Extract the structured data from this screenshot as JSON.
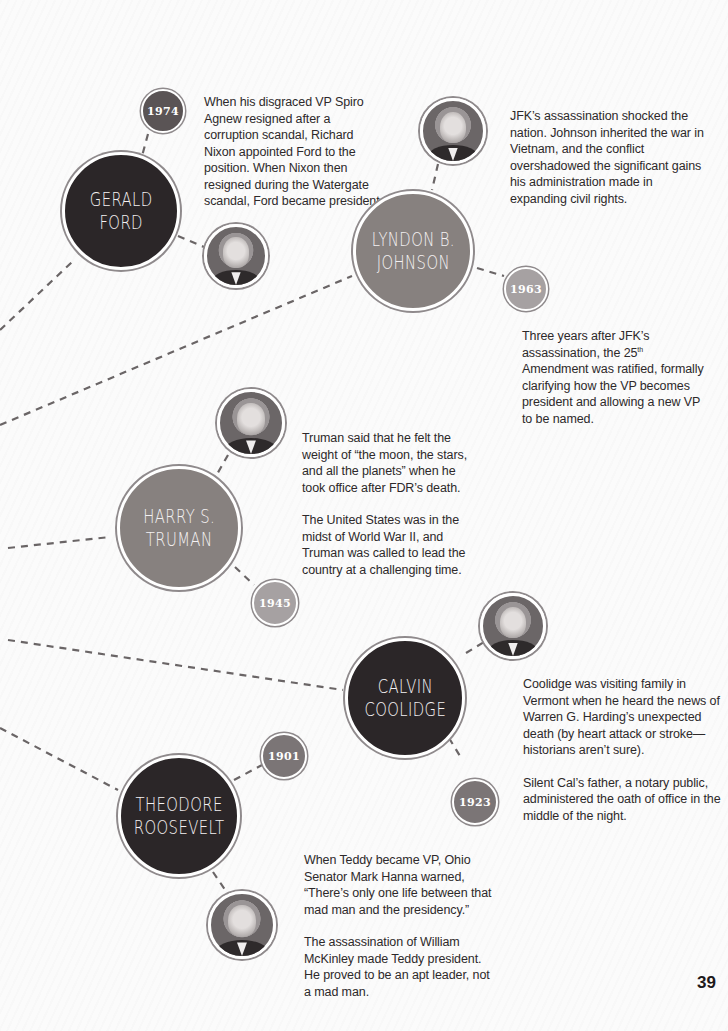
{
  "page": {
    "number": "39"
  },
  "colors": {
    "dark_circle": "#2b2628",
    "mid_circle": "#87817f",
    "ring": "#8f8a8c",
    "dash": "#6a6566",
    "text": "#2d292a"
  },
  "entries": [
    {
      "id": "ford",
      "name_line1": "GERALD",
      "name_line2": "FORD",
      "year": "1974",
      "photo_icon": "gerald-ford-portrait",
      "paragraphs": [
        "When his disgraced VP Spiro Agnew resigned after a corruption scandal, Richard Nixon appointed Ford to the position. When Nixon then resigned during the Watergate scandal, Ford became president."
      ]
    },
    {
      "id": "johnson",
      "name_line1": "LYNDON B.",
      "name_line2": "JOHNSON",
      "year": "1963",
      "photo_icon": "lyndon-johnson-portrait",
      "paragraphs": [
        "JFK’s assassination shocked the nation. Johnson inherited the war in Vietnam, and the conflict overshadowed the significant gains his administration made in expanding civil rights."
      ],
      "extra": {
        "before_sup": "Three years after JFK’s assassination, the 25",
        "sup": "th",
        "after_sup": " Amendment was ratified, formally clarifying how the VP becomes president and allowing a new VP to be named."
      }
    },
    {
      "id": "truman",
      "name_line1": "HARRY S.",
      "name_line2": "TRUMAN",
      "year": "1945",
      "photo_icon": "harry-truman-portrait",
      "paragraphs": [
        "Truman said that he felt the weight of “the moon, the stars, and all the planets” when he took office after FDR’s death.",
        "The United States was in the midst of World War II, and Truman was called to lead the country at a challenging time."
      ]
    },
    {
      "id": "coolidge",
      "name_line1": "CALVIN",
      "name_line2": "COOLIDGE",
      "year": "1923",
      "photo_icon": "calvin-coolidge-portrait",
      "paragraphs": [
        "Coolidge was visiting family in Vermont when he heard the news of Warren G. Harding’s unexpected death (by heart attack or stroke—historians aren’t sure).",
        "Silent Cal’s father, a notary public, administered the oath of office in the middle of the night."
      ]
    },
    {
      "id": "roosevelt",
      "name_line1": "THEODORE",
      "name_line2": "ROOSEVELT",
      "year": "1901",
      "photo_icon": "theodore-roosevelt-portrait",
      "paragraphs": [
        "When Teddy became VP, Ohio Senator Mark Hanna warned, “There’s only one life between that mad man and the presidency.”",
        "The assassination of William McKinley made Teddy president. He proved to be an apt leader, not a mad man."
      ]
    }
  ]
}
